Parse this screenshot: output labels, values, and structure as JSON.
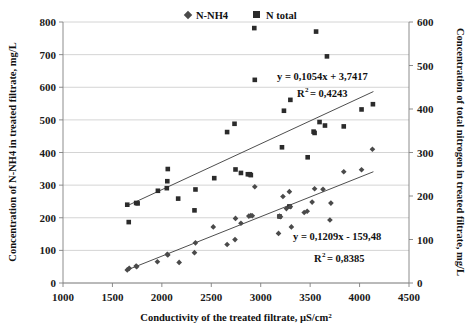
{
  "chart_data": {
    "type": "scatter",
    "title": "",
    "xlabel": "Conductivity of the treated filtrate, µS/cm²",
    "ylabel": "Concentration of N-NH4 in treated filtrate, mg/L",
    "y2label": "Concentration of total nitrogen in treated filtrate, mg/L",
    "xlim": [
      1000,
      4500
    ],
    "ylim": [
      0,
      800
    ],
    "y2lim": [
      0,
      600
    ],
    "xticks": [
      1000,
      1500,
      2000,
      2500,
      3000,
      3500,
      4000,
      4500
    ],
    "yticks": [
      0,
      100,
      200,
      300,
      400,
      500,
      600,
      700,
      800
    ],
    "y2ticks": [
      0,
      100,
      200,
      300,
      400,
      500,
      600
    ],
    "grid": true,
    "legend_position": "top-center",
    "series": [
      {
        "name": "N-NH4",
        "marker": "diamond",
        "axis": "left",
        "color": "#4a4a4a",
        "points": [
          [
            1650,
            40
          ],
          [
            1670,
            45
          ],
          [
            1740,
            52
          ],
          [
            1745,
            50
          ],
          [
            1955,
            65
          ],
          [
            2055,
            88
          ],
          [
            2060,
            86
          ],
          [
            2175,
            63
          ],
          [
            2330,
            93
          ],
          [
            2340,
            123
          ],
          [
            2520,
            172
          ],
          [
            2660,
            118
          ],
          [
            2740,
            133
          ],
          [
            2745,
            198
          ],
          [
            2800,
            183
          ],
          [
            2880,
            205
          ],
          [
            2900,
            207
          ],
          [
            2915,
            206
          ],
          [
            2940,
            295
          ],
          [
            3180,
            152
          ],
          [
            3190,
            205
          ],
          [
            3200,
            203
          ],
          [
            3225,
            265
          ],
          [
            3260,
            228
          ],
          [
            3290,
            280
          ],
          [
            3300,
            234
          ],
          [
            3310,
            172
          ],
          [
            3440,
            216
          ],
          [
            3470,
            220
          ],
          [
            3520,
            248
          ],
          [
            3545,
            289
          ],
          [
            3630,
            287
          ],
          [
            3700,
            193
          ],
          [
            3710,
            245
          ],
          [
            3840,
            341
          ],
          [
            4020,
            347
          ],
          [
            4130,
            410
          ]
        ]
      },
      {
        "name": "N total",
        "marker": "square",
        "axis": "right",
        "color": "#2b2b2b",
        "points": [
          [
            1650,
            180
          ],
          [
            1665,
            140
          ],
          [
            1740,
            184
          ],
          [
            1755,
            183
          ],
          [
            1960,
            212
          ],
          [
            2050,
            218
          ],
          [
            2055,
            234
          ],
          [
            2060,
            262
          ],
          [
            2165,
            194
          ],
          [
            2330,
            167
          ],
          [
            2340,
            215
          ],
          [
            2530,
            241
          ],
          [
            2660,
            347
          ],
          [
            2735,
            366
          ],
          [
            2745,
            261
          ],
          [
            2800,
            253
          ],
          [
            2870,
            250
          ],
          [
            2890,
            250
          ],
          [
            2900,
            248
          ],
          [
            2935,
            586
          ],
          [
            2940,
            467
          ],
          [
            3190,
            153
          ],
          [
            3215,
            312
          ],
          [
            3235,
            396
          ],
          [
            3290,
            176
          ],
          [
            3300,
            421
          ],
          [
            3475,
            289
          ],
          [
            3535,
            348
          ],
          [
            3545,
            345
          ],
          [
            3560,
            578
          ],
          [
            3595,
            370
          ],
          [
            3650,
            362
          ],
          [
            3670,
            521
          ],
          [
            3840,
            360
          ],
          [
            4020,
            399
          ],
          [
            4135,
            411
          ]
        ]
      }
    ],
    "trendlines": [
      {
        "name": "N total trendline",
        "axis": "right",
        "equation": "y = 0,1054x + 3,7417",
        "r2_label": "R",
        "r2_exp": "2",
        "r2_value": "= 0,4243",
        "slope": 0.1054,
        "intercept": 3.7417,
        "x_start": 1640,
        "x_end": 4140
      },
      {
        "name": "N-NH4 trendline",
        "axis": "left",
        "equation": "y = 0,1209x - 159,48",
        "r2_label": "R",
        "r2_exp": "2",
        "r2_value": "= 0,8385",
        "slope": 0.1209,
        "intercept": -159.48,
        "x_start": 1640,
        "x_end": 4140
      }
    ]
  },
  "legend": {
    "items": [
      {
        "label": "N-NH4",
        "marker": "diamond"
      },
      {
        "label": "N total",
        "marker": "square"
      }
    ]
  },
  "annotations": {
    "top": {
      "equation": "y = 0,1054x + 3,7417",
      "r_base": "R",
      "r_exp": "2",
      "r_rest": "= 0,4243"
    },
    "bottom": {
      "equation": "y = 0,1209x - 159,48",
      "r_base": "R",
      "r_exp": "2",
      "r_rest": "= 0,8385"
    }
  },
  "axes": {
    "x_title": "Conductivity of the treated filtrate, µS/cm²",
    "x_title_base": "Conductivity of the treated filtrate, µS/cm",
    "x_title_sup": "2",
    "y_left_title": "Concentration of N-NH4 in treated filtrate, mg/L",
    "y_right_title": "Concentration of total nitrogen in treated filtrate, mg/L"
  },
  "colors": {
    "marker_square": "#2b2b2b",
    "marker_diamond": "#4a4a4a",
    "gridline": "#c9c9c9",
    "axis": "#808080",
    "trendline": "#3a3a3a",
    "text": "#111111",
    "background": "#ffffff"
  }
}
